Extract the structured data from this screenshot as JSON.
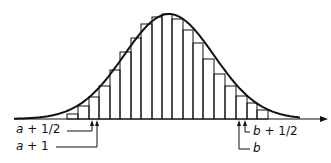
{
  "figure": {
    "line_color": "#111111",
    "background": "#ffffff"
  },
  "labels": {
    "a_half": "a + 1/2",
    "a_one": "a + 1",
    "b_half": "b + 1/2",
    "b": "b"
  },
  "axis": {
    "y": 119,
    "x_start": 15,
    "x_end": 328
  },
  "bars": {
    "edges": [
      67,
      78,
      89,
      99,
      110,
      120,
      131,
      141,
      152,
      162,
      172,
      183,
      193,
      203,
      214,
      225,
      236,
      247,
      257,
      268
    ],
    "tops": [
      114,
      106,
      97,
      86,
      70,
      52,
      38,
      24,
      17,
      14,
      19,
      30,
      43,
      59,
      74,
      86,
      96,
      103,
      110
    ]
  },
  "markers": {
    "a_half_x": 92,
    "a_one_x": 97,
    "b_x": 239,
    "b_half_x": 245
  }
}
